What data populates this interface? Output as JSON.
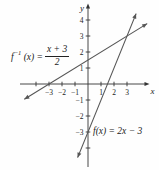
{
  "figure": {
    "background": "#fefefe",
    "axis_color": "#333333",
    "line_color": "#555555",
    "text_color": "#222222"
  },
  "chart_data": {
    "type": "line",
    "title": "",
    "xlabel": "x",
    "ylabel": "y",
    "xlim": [
      -4.9,
      4.7
    ],
    "ylim": [
      -4.7,
      4.7
    ],
    "grid": false,
    "legend": "none",
    "x_ticks": [
      -4,
      -3,
      -2,
      -1,
      1,
      2,
      3
    ],
    "x_tick_labels": [
      "",
      "−3",
      "−2",
      "−1",
      "1",
      "2",
      "3"
    ],
    "y_ticks": [
      -4,
      -3,
      -2,
      -1,
      1,
      2,
      3,
      4
    ],
    "y_tick_labels": [
      "",
      "−3",
      "−2",
      "−1",
      "1",
      "2",
      "3",
      "4"
    ],
    "series": [
      {
        "name": "f",
        "equation": "f(x) = 2x − 3",
        "slope": 2,
        "intercept": -3,
        "draw_range_x": [
          -0.8,
          3.7
        ],
        "key_points": [
          [
            0,
            -3
          ],
          [
            1.5,
            0
          ],
          [
            3,
            3
          ]
        ]
      },
      {
        "name": "f-inverse",
        "equation": "f⁻¹(x) = (x + 3)/2",
        "slope": 0.5,
        "intercept": 1.5,
        "draw_range_x": [
          -4.9,
          4.55
        ],
        "key_points": [
          [
            -3,
            0
          ],
          [
            0,
            1.5
          ],
          [
            3,
            3
          ]
        ]
      }
    ],
    "intersection_point": [
      3,
      3
    ],
    "labels": {
      "f_inverse_eq": {
        "func": "f",
        "sup": "−1",
        "arg": "(x) =",
        "frac_num": "x + 3",
        "frac_den": "2"
      },
      "f_eq": "f(x) = 2x − 3"
    }
  }
}
